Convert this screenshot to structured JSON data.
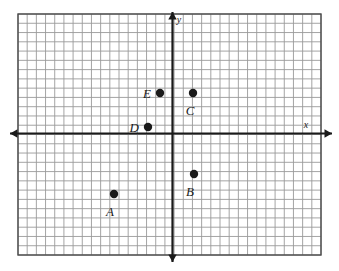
{
  "figure": {
    "kind": "coordinate-plane",
    "background_color": "#ffffff"
  },
  "chart_data": {
    "type": "scatter",
    "title": "",
    "xlabel": "x",
    "ylabel": "y",
    "grid": true,
    "grid_step": 1,
    "legend": "none",
    "xlim": [
      -16.5,
      16
    ],
    "ylim": [
      -13,
      13
    ],
    "axis_origin_px": {
      "x": 172.5,
      "y": 133.5
    },
    "cell_size_px": 9.3,
    "points": [
      {
        "label": "A",
        "x": -6,
        "y": -6.5,
        "px": 114,
        "py": 194,
        "label_px": 110,
        "label_py": 216,
        "label_anchor": "middle"
      },
      {
        "label": "B",
        "x": 2.5,
        "y": -4.5,
        "px": 194,
        "py": 174,
        "label_px": 190,
        "label_py": 196,
        "label_anchor": "middle"
      },
      {
        "label": "C",
        "x": 2.5,
        "y": 4.5,
        "px": 193,
        "py": 93,
        "label_px": 190,
        "label_py": 115,
        "label_anchor": "middle"
      },
      {
        "label": "D",
        "x": -2.5,
        "y": 0.5,
        "px": 148,
        "py": 127,
        "label_px": 139,
        "label_py": 132,
        "label_anchor": "end"
      },
      {
        "label": "E",
        "x": -1.5,
        "y": 4.5,
        "px": 160,
        "py": 93,
        "label_px": 151,
        "label_py": 98,
        "label_anchor": "end"
      }
    ],
    "point_style": {
      "marker": "filled-circle",
      "radius_px": 4.2,
      "color": "#1a1a1a"
    },
    "axes": {
      "x_axis": {
        "label": "x",
        "label_px": 306,
        "label_py": 128,
        "y_px": 133.5,
        "x_start_px": 10,
        "x_end_px": 332,
        "arrow_left": true,
        "arrow_right": true
      },
      "y_axis": {
        "label": "y",
        "label_px": 179,
        "label_py": 23,
        "x_px": 172.5,
        "y_start_px": 12,
        "y_end_px": 262,
        "arrow_up": true,
        "arrow_down": true
      }
    }
  },
  "grid": {
    "left_px": 18,
    "top_px": 14,
    "right_px": 321,
    "bottom_px": 255,
    "cols": 33,
    "rows": 26,
    "minor_color": "#9a9a9a",
    "border_color": "#4a4a4a",
    "axis_color": "#1a1a1a"
  },
  "colors": {
    "background": "#ffffff",
    "gridline": "#9a9a9a",
    "grid_border": "#4a4a4a",
    "axis": "#1a1a1a",
    "point": "#1a1a1a",
    "label_text": "#1a1a1a"
  }
}
